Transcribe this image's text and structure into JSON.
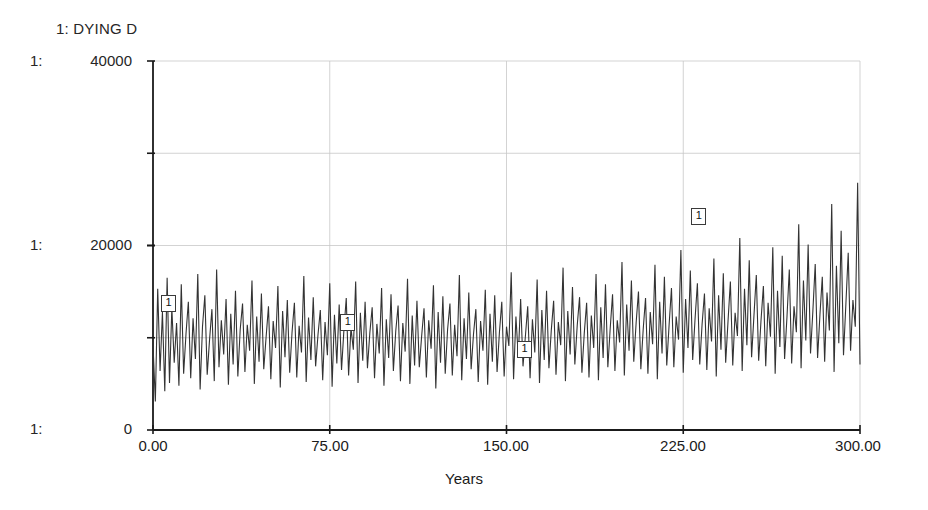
{
  "chart_data": {
    "type": "line",
    "title": "1: DYING D",
    "series_name": "DYING D",
    "series_index": "1",
    "xlabel": "Years",
    "ylabel": "",
    "xlim": [
      0,
      300
    ],
    "ylim": [
      0,
      40000
    ],
    "grid": true,
    "legend": "none",
    "x_tick_labels": [
      "0.00",
      "75.00",
      "150.00",
      "225.00",
      "300.00"
    ],
    "x_ticks": [
      0,
      75,
      150,
      225,
      300
    ],
    "y_tick_labels": [
      "40000",
      "20000",
      "0"
    ],
    "y_ticks": [
      40000,
      20000,
      0
    ],
    "y_axis_prefix": "1:",
    "gridline_values_y": [
      30000,
      20000,
      10000
    ],
    "gridline_values_x": [
      75,
      150,
      225
    ],
    "series_color": "#333333",
    "grid_color": "#c8c8c8",
    "axis_color": "#1a1a1a",
    "background_color": "#ffffff",
    "marker_label": "1",
    "markers": [
      {
        "x": 6,
        "y": 13800
      },
      {
        "x": 82,
        "y": 11700
      },
      {
        "x": 157,
        "y": 8800
      },
      {
        "x": 231,
        "y": 23200
      }
    ],
    "x": [
      0,
      1,
      2,
      3,
      4,
      5,
      6,
      7,
      8,
      9,
      10,
      11,
      12,
      13,
      14,
      15,
      16,
      17,
      18,
      19,
      20,
      21,
      22,
      23,
      24,
      25,
      26,
      27,
      28,
      29,
      30,
      31,
      32,
      33,
      34,
      35,
      36,
      37,
      38,
      39,
      40,
      41,
      42,
      43,
      44,
      45,
      46,
      47,
      48,
      49,
      50,
      51,
      52,
      53,
      54,
      55,
      56,
      57,
      58,
      59,
      60,
      61,
      62,
      63,
      64,
      65,
      66,
      67,
      68,
      69,
      70,
      71,
      72,
      73,
      74,
      75,
      76,
      77,
      78,
      79,
      80,
      81,
      82,
      83,
      84,
      85,
      86,
      87,
      88,
      89,
      90,
      91,
      92,
      93,
      94,
      95,
      96,
      97,
      98,
      99,
      100,
      101,
      102,
      103,
      104,
      105,
      106,
      107,
      108,
      109,
      110,
      111,
      112,
      113,
      114,
      115,
      116,
      117,
      118,
      119,
      120,
      121,
      122,
      123,
      124,
      125,
      126,
      127,
      128,
      129,
      130,
      131,
      132,
      133,
      134,
      135,
      136,
      137,
      138,
      139,
      140,
      141,
      142,
      143,
      144,
      145,
      146,
      147,
      148,
      149,
      150,
      151,
      152,
      153,
      154,
      155,
      156,
      157,
      158,
      159,
      160,
      161,
      162,
      163,
      164,
      165,
      166,
      167,
      168,
      169,
      170,
      171,
      172,
      173,
      174,
      175,
      176,
      177,
      178,
      179,
      180,
      181,
      182,
      183,
      184,
      185,
      186,
      187,
      188,
      189,
      190,
      191,
      192,
      193,
      194,
      195,
      196,
      197,
      198,
      199,
      200,
      201,
      202,
      203,
      204,
      205,
      206,
      207,
      208,
      209,
      210,
      211,
      212,
      213,
      214,
      215,
      216,
      217,
      218,
      219,
      220,
      221,
      222,
      223,
      224,
      225,
      226,
      227,
      228,
      229,
      230,
      231,
      232,
      233,
      234,
      235,
      236,
      237,
      238,
      239,
      240,
      241,
      242,
      243,
      244,
      245,
      246,
      247,
      248,
      249,
      250,
      251,
      252,
      253,
      254,
      255,
      256,
      257,
      258,
      259,
      260,
      261,
      262,
      263,
      264,
      265,
      266,
      267,
      268,
      269,
      270,
      271,
      272,
      273,
      274,
      275,
      276,
      277,
      278,
      279,
      280,
      281,
      282,
      283,
      284,
      285,
      286,
      287,
      288,
      289,
      290,
      291,
      292,
      293,
      294,
      295,
      296,
      297,
      298,
      299,
      300
    ],
    "y": [
      9200,
      3100,
      15300,
      6400,
      12800,
      4200,
      16500,
      5100,
      13200,
      7300,
      11600,
      4800,
      15800,
      6100,
      10400,
      13900,
      5600,
      12100,
      7700,
      16900,
      4400,
      11200,
      14600,
      6000,
      9800,
      13100,
      5300,
      17400,
      6800,
      11900,
      8200,
      14200,
      4900,
      12600,
      7100,
      15100,
      5800,
      10900,
      13700,
      6300,
      11400,
      8600,
      16200,
      5000,
      12300,
      7400,
      14800,
      6600,
      10100,
      13400,
      5500,
      11800,
      8900,
      15600,
      4600,
      12900,
      7900,
      14100,
      6200,
      10600,
      13800,
      5700,
      11300,
      8400,
      16700,
      5200,
      12200,
      7600,
      14400,
      6900,
      10300,
      13000,
      5400,
      11700,
      8100,
      15900,
      4700,
      12500,
      7200,
      13600,
      6500,
      10800,
      14300,
      5900,
      11100,
      8700,
      16100,
      5100,
      12700,
      7500,
      13900,
      6700,
      10500,
      13300,
      5600,
      11500,
      8300,
      15400,
      4800,
      12000,
      7800,
      14700,
      6400,
      10700,
      13500,
      5300,
      11600,
      8500,
      16400,
      5000,
      12400,
      7000,
      14000,
      6800,
      10200,
      13200,
      5700,
      11900,
      8800,
      15700,
      4500,
      12800,
      7300,
      14500,
      6100,
      10900,
      13700,
      5900,
      11400,
      8000,
      16800,
      5400,
      12100,
      7700,
      14900,
      6600,
      10400,
      13100,
      5200,
      11800,
      8600,
      15200,
      4900,
      12600,
      7400,
      14600,
      6300,
      10600,
      13900,
      5800,
      11200,
      9100,
      17100,
      5500,
      12300,
      7900,
      14200,
      6900,
      10100,
      13400,
      5600,
      12000,
      8400,
      16300,
      5100,
      13000,
      7600,
      15100,
      6700,
      10800,
      14000,
      6000,
      11700,
      9200,
      17600,
      5300,
      12900,
      8200,
      15500,
      7100,
      11300,
      14400,
      6200,
      10500,
      13800,
      5700,
      12400,
      8900,
      16900,
      5400,
      13300,
      7800,
      15800,
      6800,
      11000,
      14700,
      6400,
      11900,
      9500,
      18200,
      5900,
      13600,
      8600,
      16200,
      7400,
      11600,
      15000,
      6600,
      10900,
      14300,
      6100,
      12800,
      9300,
      17900,
      5500,
      13900,
      8300,
      16600,
      7000,
      11400,
      15400,
      6800,
      12300,
      9800,
      19500,
      6200,
      14200,
      8900,
      17300,
      7600,
      12000,
      15900,
      7100,
      11500,
      14800,
      6500,
      13200,
      9600,
      18600,
      5800,
      14600,
      8700,
      17000,
      7300,
      11800,
      16100,
      7000,
      12700,
      10200,
      20800,
      6400,
      15300,
      9200,
      18400,
      7900,
      12400,
      16800,
      7500,
      11900,
      15600,
      6900,
      13800,
      10100,
      19800,
      6100,
      15100,
      9000,
      18900,
      7700,
      12200,
      17400,
      7200,
      13400,
      10600,
      22300,
      6700,
      16200,
      9700,
      20100,
      8300,
      12900,
      18000,
      7800,
      12500,
      16600,
      7400,
      14900,
      10800,
      24500,
      6300,
      17800,
      9400,
      21600,
      8100,
      13600,
      19200,
      8600,
      14100,
      11200,
      26800,
      7100,
      19400,
      10300,
      23800,
      8800,
      15200,
      21500,
      9100,
      15800,
      12000,
      29600,
      7600,
      22100,
      11500,
      26400,
      9500,
      16900,
      24300,
      10200,
      17500,
      13200,
      33200,
      8400,
      25600,
      12800,
      30200,
      10900,
      19400,
      28100,
      11600,
      20300,
      15100,
      35400,
      9300,
      26800,
      14200,
      31500,
      11800,
      21000,
      29400,
      12400,
      23800,
      18600
    ],
    "n_points": 301
  }
}
